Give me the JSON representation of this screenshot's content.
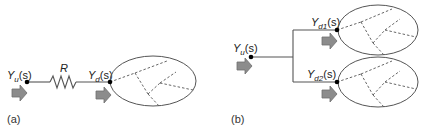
{
  "figure": {
    "panels": [
      {
        "id": "a",
        "label": "(a)",
        "upstream": {
          "symbol": "Y",
          "subscript": "u",
          "arg": "(s)"
        },
        "resistor": {
          "label": "R"
        },
        "downstream": {
          "symbol": "Y",
          "subscript": "d",
          "arg": "(s)"
        },
        "networks": 1
      },
      {
        "id": "b",
        "label": "(b)",
        "upstream": {
          "symbol": "Y",
          "subscript": "u",
          "arg": "(s)"
        },
        "branches": [
          {
            "symbol": "Y",
            "subscript": "d1",
            "arg": "(s)"
          },
          {
            "symbol": "Y",
            "subscript": "d2",
            "arg": "(s)"
          }
        ],
        "networks": 2
      }
    ],
    "colors": {
      "line": "#555555",
      "arrow_fill": "#8c8c8c",
      "arrow_stroke": "#6e6e6e",
      "node": "#000000",
      "dashed": "#555555"
    }
  }
}
